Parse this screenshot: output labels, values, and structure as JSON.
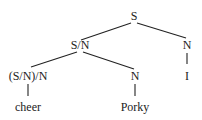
{
  "diagram": {
    "type": "parse-tree",
    "colors": {
      "line": "#222222",
      "text": "#222222",
      "background": "#ffffff"
    },
    "nodes": {
      "root": {
        "label": "S",
        "x": 134,
        "y": 20
      },
      "sn": {
        "label": "S/N",
        "x": 80,
        "y": 49
      },
      "n_right": {
        "label": "N",
        "x": 187,
        "y": 49
      },
      "i_leaf": {
        "label": "I",
        "x": 187,
        "y": 80
      },
      "snn": {
        "label": "(S/N)/N",
        "x": 28,
        "y": 80
      },
      "n_mid": {
        "label": "N",
        "x": 135,
        "y": 80
      },
      "cheer_leaf": {
        "label": "cheer",
        "x": 28,
        "y": 111
      },
      "porky_leaf": {
        "label": "Porky",
        "x": 135,
        "y": 111
      }
    },
    "edges": [
      {
        "from": "root",
        "to": "sn"
      },
      {
        "from": "root",
        "to": "n_right"
      },
      {
        "from": "sn",
        "to": "snn"
      },
      {
        "from": "sn",
        "to": "n_mid"
      },
      {
        "from": "n_right",
        "to": "i_leaf"
      },
      {
        "from": "snn",
        "to": "cheer_leaf"
      },
      {
        "from": "n_mid",
        "to": "porky_leaf"
      }
    ]
  }
}
